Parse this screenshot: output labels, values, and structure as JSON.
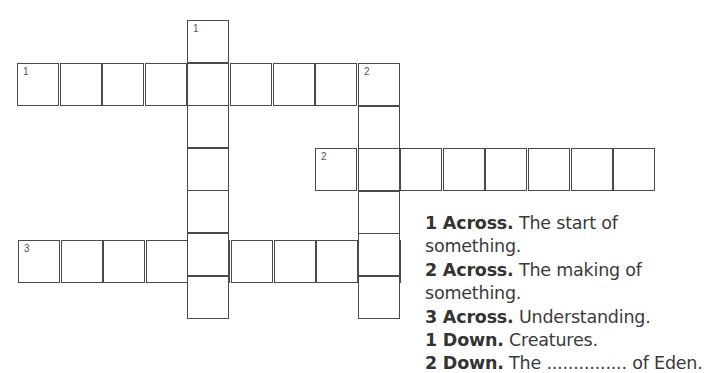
{
  "puzzle": {
    "cell_size": 42.6,
    "entries": [
      {
        "id": "1-across",
        "number": "1",
        "direction": "across",
        "length": 9,
        "x": 17,
        "y": 63
      },
      {
        "id": "2-across",
        "number": "2",
        "direction": "across",
        "length": 8,
        "x": 315,
        "y": 148
      },
      {
        "id": "3-across",
        "number": "3",
        "direction": "across",
        "length": 9,
        "x": 18,
        "y": 240
      },
      {
        "id": "1-down",
        "number": "1",
        "direction": "down",
        "length": 7,
        "x": 187,
        "y": 20
      },
      {
        "id": "2-down",
        "number": "2",
        "direction": "down",
        "length": 6,
        "x": 358,
        "y": 63
      }
    ]
  },
  "clues": [
    {
      "label": "1 Across.",
      "text": "The start of something."
    },
    {
      "label": "2 Across.",
      "text": "The making of something."
    },
    {
      "label": "3 Across.",
      "text": "Understanding."
    },
    {
      "label": "1 Down.",
      "text": "Creatures."
    },
    {
      "label": "2 Down.",
      "text": "The ............... of Eden."
    }
  ]
}
